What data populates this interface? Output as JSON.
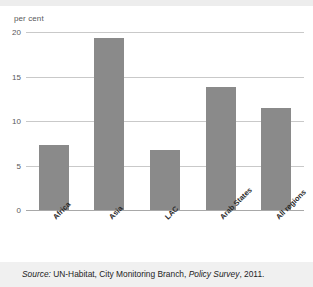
{
  "figure": {
    "background_color": "#ffffff",
    "bar_color": "#8a8a8a",
    "grid_color": "#c9c9c9",
    "axis_unit_label": "per cent"
  },
  "source": {
    "prefix": "Source:",
    "body": " UN-Habitat, City Monitoring Branch, ",
    "publication": "Policy Survey",
    "suffix": ", 2011."
  },
  "chart_data": {
    "type": "bar",
    "title": "",
    "xlabel": "",
    "ylabel": "per cent",
    "categories": [
      "Africa",
      "Asia",
      "LAC",
      "Arab States",
      "All regions"
    ],
    "values": [
      7.3,
      19.3,
      6.7,
      13.8,
      11.5
    ],
    "ylim": [
      0,
      20
    ],
    "yticks": [
      0,
      5,
      10,
      15,
      20
    ],
    "ytick_labels": [
      "0",
      "5",
      "10",
      "15",
      "20"
    ],
    "grid": true,
    "grid_axis": "y",
    "legend": false,
    "legend_position": "none",
    "series": [
      {
        "name": "per cent",
        "values": [
          7.3,
          19.3,
          6.7,
          13.8,
          11.5
        ]
      }
    ]
  }
}
